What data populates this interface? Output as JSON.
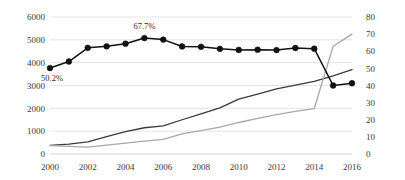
{
  "chart_data": {
    "type": "line",
    "title": "",
    "subtitle": "",
    "xlabel": "",
    "ylabel": "",
    "grid": true,
    "legend_position": "none",
    "x": [
      2000,
      2001,
      2002,
      2003,
      2004,
      2005,
      2006,
      2007,
      2008,
      2009,
      2010,
      2011,
      2012,
      2013,
      2014,
      2015,
      2016
    ],
    "x_tick_labels": [
      "2000",
      "2002",
      "2004",
      "2006",
      "2008",
      "2010",
      "2012",
      "2014",
      "2016"
    ],
    "x_tick_values": [
      2000,
      2002,
      2004,
      2006,
      2008,
      2010,
      2012,
      2014,
      2016
    ],
    "xlim": [
      2000,
      2016
    ],
    "left_axis": {
      "ylim": [
        0,
        6000
      ],
      "ticks": [
        0,
        1000,
        2000,
        3000,
        4000,
        5000,
        6000
      ],
      "tick_labels": [
        "0",
        "1000",
        "2000",
        "3000",
        "4000",
        "5000",
        "6000"
      ]
    },
    "right_axis": {
      "ylim": [
        0,
        80
      ],
      "ticks": [
        0,
        10,
        20,
        30,
        40,
        50,
        60,
        70,
        80
      ],
      "tick_labels": [
        "0",
        "10",
        "20",
        "30",
        "40",
        "50",
        "60",
        "70",
        "80"
      ]
    },
    "series": [
      {
        "name": "dark-line",
        "axis": "left",
        "type": "line",
        "color": "#3a3a3a",
        "marker": false,
        "values": [
          380,
          430,
          530,
          760,
          980,
          1150,
          1230,
          1500,
          1760,
          2020,
          2400,
          2620,
          2850,
          3020,
          3180,
          3420,
          3700
        ]
      },
      {
        "name": "gray-line",
        "axis": "left",
        "type": "line",
        "color": "#a8a8a8",
        "marker": false,
        "values": [
          370,
          330,
          300,
          390,
          480,
          560,
          640,
          880,
          1020,
          1180,
          1380,
          1560,
          1720,
          1870,
          1990,
          4720,
          5250
        ]
      },
      {
        "name": "marker-line",
        "axis": "right",
        "type": "line",
        "color": "#111111",
        "marker": true,
        "values": [
          50.2,
          54.0,
          62.0,
          62.9,
          64.4,
          67.7,
          66.8,
          62.8,
          62.6,
          61.4,
          60.8,
          60.9,
          60.7,
          61.9,
          61.5,
          40.0,
          41.3
        ]
      }
    ],
    "annotations": [
      {
        "text": "50.2%",
        "x": 2000,
        "value": 50.2,
        "axis": "right",
        "position": "below-left"
      },
      {
        "text": "67.7%",
        "x": 2005,
        "value": 67.7,
        "axis": "right",
        "position": "above"
      }
    ]
  }
}
